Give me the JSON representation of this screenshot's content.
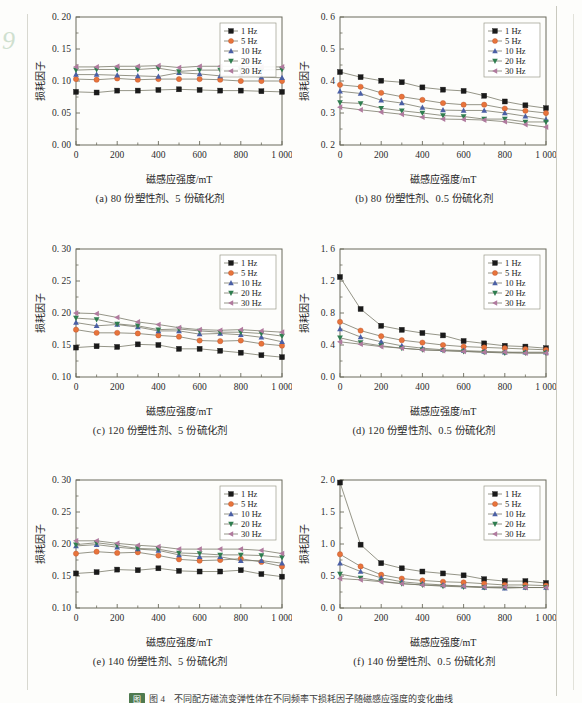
{
  "page": {
    "number": "9",
    "note": "图 4　不同配方磁流变弹性体在不同频率下损耗因子随磁感应强度的变化曲线",
    "note_tag": "图"
  },
  "axis_titles": {
    "x": "磁感应强度/mT",
    "y": "损耗因子"
  },
  "legend": {
    "entries": [
      "1 Hz",
      "5 Hz",
      "10 Hz",
      "20 Hz",
      "30 Hz"
    ],
    "markers": [
      "square",
      "circle",
      "triangle-up",
      "triangle-down",
      "triangle-left"
    ],
    "colors": [
      "#1a1a1a",
      "#e8743b",
      "#4a5fa5",
      "#2f7d4f",
      "#b07a9e"
    ],
    "position": "top-right"
  },
  "colors": {
    "axis": "#6b6b5c",
    "line": "#7a7a6a",
    "background": "#fdfdfb",
    "rule": "#d8d8d0"
  },
  "captions": {
    "a": "(a) 80 份塑性剂、5 份硫化剂",
    "b": "(b) 80 份塑性剂、0.5 份硫化剂",
    "c": "(c) 120 份塑性剂、5 份硫化剂",
    "d": "(d) 120 份塑性剂、0.5 份硫化剂",
    "e": "(e) 140 份塑性剂、5 份硫化剂",
    "f": "(f) 140 份塑性剂、0.5 份硫化剂"
  },
  "chart_data": [
    {
      "id": "a",
      "type": "line",
      "title": "(a) 80 份塑性剂、5 份硫化剂",
      "xlabel": "磁感应强度/mT",
      "ylabel": "损耗因子",
      "xlim": [
        0,
        1000
      ],
      "ylim": [
        0.0,
        0.2
      ],
      "xticks": [
        0,
        200,
        400,
        600,
        800,
        1000
      ],
      "xticklabels": [
        "0",
        "200",
        "400",
        "600",
        "800",
        "1 000"
      ],
      "yticks": [
        0.0,
        0.05,
        0.1,
        0.15,
        0.2
      ],
      "yticklabels": [
        "0. 00",
        "0. 05",
        "0. 10",
        "0. 15",
        "0. 20"
      ],
      "grid": false,
      "x": [
        0,
        100,
        200,
        300,
        400,
        500,
        600,
        700,
        800,
        900,
        1000
      ],
      "series": [
        {
          "name": "1 Hz",
          "values": [
            0.083,
            0.082,
            0.085,
            0.085,
            0.086,
            0.087,
            0.086,
            0.085,
            0.085,
            0.084,
            0.083
          ]
        },
        {
          "name": "5 Hz",
          "values": [
            0.103,
            0.102,
            0.104,
            0.102,
            0.103,
            0.103,
            0.103,
            0.102,
            0.1,
            0.1,
            0.1
          ]
        },
        {
          "name": "10 Hz",
          "values": [
            0.11,
            0.11,
            0.109,
            0.108,
            0.107,
            0.113,
            0.111,
            0.108,
            0.11,
            0.106,
            0.105
          ]
        },
        {
          "name": "20 Hz",
          "values": [
            0.117,
            0.118,
            0.118,
            0.118,
            0.12,
            0.115,
            0.117,
            0.117,
            0.118,
            0.117,
            0.118
          ]
        },
        {
          "name": "30 Hz",
          "values": [
            0.122,
            0.122,
            0.123,
            0.123,
            0.124,
            0.121,
            0.123,
            0.123,
            0.123,
            0.122,
            0.122
          ]
        }
      ]
    },
    {
      "id": "b",
      "type": "line",
      "title": "(b) 80 份塑性剂、0.5 份硫化剂",
      "xlabel": "磁感应强度/mT",
      "ylabel": "损耗因子",
      "xlim": [
        0,
        1000
      ],
      "ylim": [
        0.2,
        0.6
      ],
      "xticks": [
        0,
        200,
        400,
        600,
        800,
        1000
      ],
      "xticklabels": [
        "0",
        "200",
        "400",
        "600",
        "800",
        "1 000"
      ],
      "yticks": [
        0.2,
        0.3,
        0.4,
        0.5,
        0.6
      ],
      "yticklabels": [
        "0. 2",
        "0. 3",
        "0. 4",
        "0. 5",
        "0. 6"
      ],
      "grid": false,
      "x": [
        0,
        100,
        200,
        300,
        400,
        500,
        600,
        700,
        800,
        900,
        1000
      ],
      "series": [
        {
          "name": "1 Hz",
          "values": [
            0.428,
            0.412,
            0.401,
            0.396,
            0.38,
            0.373,
            0.369,
            0.354,
            0.336,
            0.324,
            0.315
          ]
        },
        {
          "name": "5 Hz",
          "values": [
            0.388,
            0.382,
            0.363,
            0.351,
            0.341,
            0.331,
            0.326,
            0.326,
            0.314,
            0.307,
            0.3
          ]
        },
        {
          "name": "10 Hz",
          "values": [
            0.368,
            0.361,
            0.34,
            0.331,
            0.317,
            0.309,
            0.308,
            0.308,
            0.3,
            0.29,
            0.28
          ]
        },
        {
          "name": "20 Hz",
          "values": [
            0.333,
            0.33,
            0.315,
            0.307,
            0.3,
            0.292,
            0.289,
            0.281,
            0.281,
            0.272,
            0.272
          ]
        },
        {
          "name": "30 Hz",
          "values": [
            0.318,
            0.31,
            0.303,
            0.296,
            0.287,
            0.281,
            0.28,
            0.278,
            0.273,
            0.264,
            0.256
          ]
        }
      ]
    },
    {
      "id": "c",
      "type": "line",
      "title": "(c) 120 份塑性剂、5 份硫化剂",
      "xlabel": "磁感应强度/mT",
      "ylabel": "损耗因子",
      "xlim": [
        0,
        1000
      ],
      "ylim": [
        0.1,
        0.3
      ],
      "xticks": [
        0,
        200,
        400,
        600,
        800,
        1000
      ],
      "xticklabels": [
        "0",
        "200",
        "400",
        "600",
        "800",
        "1 000"
      ],
      "yticks": [
        0.1,
        0.15,
        0.2,
        0.25,
        0.3
      ],
      "yticklabels": [
        "0. 10",
        "0. 15",
        "0. 20",
        "0. 25",
        "0. 30"
      ],
      "grid": false,
      "x": [
        0,
        100,
        200,
        300,
        400,
        500,
        600,
        700,
        800,
        900,
        1000
      ],
      "series": [
        {
          "name": "1 Hz",
          "values": [
            0.146,
            0.148,
            0.147,
            0.151,
            0.15,
            0.144,
            0.144,
            0.141,
            0.138,
            0.134,
            0.131
          ]
        },
        {
          "name": "5 Hz",
          "values": [
            0.174,
            0.169,
            0.169,
            0.168,
            0.165,
            0.163,
            0.157,
            0.156,
            0.157,
            0.152,
            0.149
          ]
        },
        {
          "name": "10 Hz",
          "values": [
            0.185,
            0.18,
            0.182,
            0.178,
            0.172,
            0.172,
            0.167,
            0.168,
            0.166,
            0.162,
            0.155
          ]
        },
        {
          "name": "20 Hz",
          "values": [
            0.192,
            0.19,
            0.183,
            0.18,
            0.174,
            0.175,
            0.172,
            0.17,
            0.17,
            0.168,
            0.164
          ]
        },
        {
          "name": "30 Hz",
          "values": [
            0.2,
            0.199,
            0.193,
            0.186,
            0.182,
            0.177,
            0.174,
            0.173,
            0.174,
            0.172,
            0.17
          ]
        }
      ]
    },
    {
      "id": "d",
      "type": "line",
      "title": "(d) 120 份塑性剂、0.5 份硫化剂",
      "xlabel": "磁感应强度/mT",
      "ylabel": "损耗因子",
      "xlim": [
        0,
        1000
      ],
      "ylim": [
        0.0,
        1.6
      ],
      "xticks": [
        0,
        200,
        400,
        600,
        800,
        1000
      ],
      "xticklabels": [
        "0",
        "200",
        "400",
        "600",
        "800",
        "1 000"
      ],
      "yticks": [
        0.0,
        0.4,
        0.8,
        1.2,
        1.6
      ],
      "yticklabels": [
        "0. 0",
        "0. 4",
        "0. 8",
        "1. 2",
        "1. 6"
      ],
      "grid": false,
      "x": [
        0,
        100,
        200,
        300,
        400,
        500,
        600,
        700,
        800,
        900,
        1000
      ],
      "series": [
        {
          "name": "1 Hz",
          "values": [
            1.25,
            0.85,
            0.64,
            0.59,
            0.55,
            0.52,
            0.45,
            0.42,
            0.39,
            0.38,
            0.36
          ]
        },
        {
          "name": "5 Hz",
          "values": [
            0.69,
            0.58,
            0.51,
            0.46,
            0.43,
            0.4,
            0.38,
            0.37,
            0.36,
            0.35,
            0.34
          ]
        },
        {
          "name": "10 Hz",
          "values": [
            0.6,
            0.5,
            0.44,
            0.39,
            0.36,
            0.34,
            0.33,
            0.32,
            0.31,
            0.31,
            0.31
          ]
        },
        {
          "name": "20 Hz",
          "values": [
            0.49,
            0.43,
            0.39,
            0.36,
            0.34,
            0.33,
            0.32,
            0.31,
            0.3,
            0.3,
            0.3
          ]
        },
        {
          "name": "30 Hz",
          "values": [
            0.44,
            0.41,
            0.38,
            0.36,
            0.34,
            0.33,
            0.32,
            0.31,
            0.31,
            0.3,
            0.3
          ]
        }
      ]
    },
    {
      "id": "e",
      "type": "line",
      "title": "(e) 140 份塑性剂、5 份硫化剂",
      "xlabel": "磁感应强度/mT",
      "ylabel": "损耗因子",
      "xlim": [
        0,
        1000
      ],
      "ylim": [
        0.1,
        0.3
      ],
      "xticks": [
        0,
        200,
        400,
        600,
        800,
        1000
      ],
      "xticklabels": [
        "0",
        "200",
        "400",
        "600",
        "800",
        "1 000"
      ],
      "yticks": [
        0.1,
        0.15,
        0.2,
        0.25,
        0.3
      ],
      "yticklabels": [
        "0. 10",
        "0. 15",
        "0. 20",
        "0. 25",
        "0. 30"
      ],
      "grid": false,
      "x": [
        0,
        100,
        200,
        300,
        400,
        500,
        600,
        700,
        800,
        900,
        1000
      ],
      "series": [
        {
          "name": "1 Hz",
          "values": [
            0.154,
            0.156,
            0.16,
            0.159,
            0.162,
            0.158,
            0.157,
            0.157,
            0.159,
            0.153,
            0.149
          ]
        },
        {
          "name": "5 Hz",
          "values": [
            0.185,
            0.188,
            0.186,
            0.187,
            0.182,
            0.176,
            0.174,
            0.175,
            0.177,
            0.172,
            0.165
          ]
        },
        {
          "name": "10 Hz",
          "values": [
            0.197,
            0.199,
            0.195,
            0.192,
            0.19,
            0.183,
            0.18,
            0.18,
            0.174,
            0.174,
            0.17
          ]
        },
        {
          "name": "20 Hz",
          "values": [
            0.199,
            0.202,
            0.198,
            0.193,
            0.192,
            0.186,
            0.185,
            0.183,
            0.183,
            0.182,
            0.179
          ]
        },
        {
          "name": "30 Hz",
          "values": [
            0.205,
            0.205,
            0.201,
            0.198,
            0.196,
            0.192,
            0.192,
            0.192,
            0.192,
            0.19,
            0.185
          ]
        }
      ]
    },
    {
      "id": "f",
      "type": "line",
      "title": "(f) 140 份塑性剂、0.5 份硫化剂",
      "xlabel": "磁感应强度/mT",
      "ylabel": "损耗因子",
      "xlim": [
        0,
        1000
      ],
      "ylim": [
        0.0,
        2.0
      ],
      "xticks": [
        0,
        200,
        400,
        600,
        800,
        1000
      ],
      "xticklabels": [
        "0",
        "200",
        "400",
        "600",
        "800",
        "1 000"
      ],
      "yticks": [
        0.0,
        0.5,
        1.0,
        1.5,
        2.0
      ],
      "yticklabels": [
        "0. 0",
        "0. 5",
        "1. 0",
        "1. 5",
        "2. 0"
      ],
      "grid": false,
      "x": [
        0,
        100,
        200,
        300,
        400,
        500,
        600,
        700,
        800,
        900,
        1000
      ],
      "series": [
        {
          "name": "1 Hz",
          "values": [
            1.96,
            0.99,
            0.7,
            0.62,
            0.57,
            0.54,
            0.51,
            0.45,
            0.42,
            0.42,
            0.39
          ]
        },
        {
          "name": "5 Hz",
          "values": [
            0.84,
            0.65,
            0.52,
            0.46,
            0.43,
            0.41,
            0.4,
            0.38,
            0.36,
            0.36,
            0.35
          ]
        },
        {
          "name": "10 Hz",
          "values": [
            0.7,
            0.57,
            0.47,
            0.41,
            0.38,
            0.36,
            0.34,
            0.32,
            0.31,
            0.32,
            0.32
          ]
        },
        {
          "name": "20 Hz",
          "values": [
            0.53,
            0.47,
            0.42,
            0.38,
            0.36,
            0.34,
            0.33,
            0.32,
            0.32,
            0.32,
            0.32
          ]
        },
        {
          "name": "30 Hz",
          "values": [
            0.46,
            0.44,
            0.41,
            0.38,
            0.36,
            0.35,
            0.34,
            0.33,
            0.33,
            0.32,
            0.32
          ]
        }
      ]
    }
  ]
}
